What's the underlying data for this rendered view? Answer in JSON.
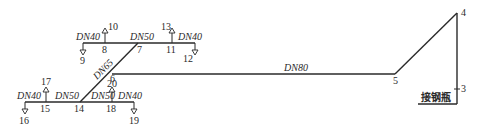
{
  "diagram": {
    "type": "pipe-system-axonometric",
    "pipes": [
      {
        "id": "main",
        "size": "DN80",
        "from": "6",
        "to": "5"
      },
      {
        "id": "riser",
        "size": "",
        "from": "5",
        "to": "4"
      },
      {
        "id": "drop",
        "size": "",
        "from": "4",
        "to": "3"
      },
      {
        "id": "diag",
        "size": "DN65",
        "from": "7",
        "to": "14"
      },
      {
        "id": "top-left",
        "size": "DN40",
        "from": "8",
        "to": "9"
      },
      {
        "id": "top-mid",
        "size": "DN50",
        "from": "8",
        "to": "11"
      },
      {
        "id": "top-right",
        "size": "DN40",
        "from": "11",
        "to": "12"
      },
      {
        "id": "bot-left",
        "size": "DN40",
        "from": "15",
        "to": "16"
      },
      {
        "id": "bot-mid",
        "size": "DN50",
        "from": "15",
        "to": "14"
      },
      {
        "id": "bot-mid2",
        "size": "DN50",
        "from": "14",
        "to": "18"
      },
      {
        "id": "bot-right",
        "size": "DN40",
        "from": "18",
        "to": "19"
      }
    ],
    "labels": {
      "dn40_top_left": "DN40",
      "dn50_top": "DN50",
      "dn40_top_right": "DN40",
      "dn65": "DN65",
      "dn80": "DN80",
      "dn40_bot_left": "DN40",
      "dn50_bot_left": "DN50",
      "dn50_bot_right": "DN50",
      "dn40_bot_right": "DN40",
      "bottle": "接钢瓶"
    },
    "nodes": {
      "n3": "3",
      "n4": "4",
      "n5": "5",
      "n6": "6",
      "n7": "7",
      "n8": "8",
      "n9": "9",
      "n10": "10",
      "n11": "11",
      "n12": "12",
      "n13": "13",
      "n14": "14",
      "n15": "15",
      "n16": "16",
      "n17": "17",
      "n18": "18",
      "n19": "19",
      "n20": "20"
    },
    "outlets_up": [
      "10",
      "13",
      "17",
      "20"
    ],
    "outlets_down": [
      "9",
      "12",
      "16",
      "19"
    ]
  }
}
